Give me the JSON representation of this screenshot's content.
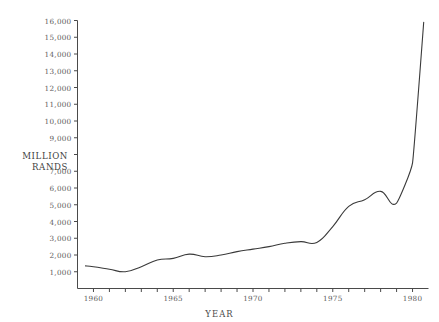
{
  "chart_data": {
    "type": "line",
    "title": "",
    "subtitle": "",
    "xlabel": "YEAR",
    "ylabel": "MILLION RANDS",
    "ylabel_lines": [
      "MILLION",
      "RANDS"
    ],
    "xlim": [
      1959,
      1981
    ],
    "ylim": [
      0,
      16000
    ],
    "grid": false,
    "legend": null,
    "y_ticks": [
      1000,
      2000,
      3000,
      4000,
      5000,
      6000,
      7000,
      8000,
      9000,
      10000,
      11000,
      12000,
      13000,
      14000,
      15000,
      16000
    ],
    "y_tick_labels": [
      "1,000",
      "2,000",
      "3,000",
      "4,000",
      "5,000",
      "6,000",
      "7,000",
      "",
      "9,000",
      "10,000",
      "11,000",
      "12,000",
      "13,000",
      "14,000",
      "15,000",
      "16,000"
    ],
    "y_tick_label_hidden_note": "8,000 tick label is replaced by the axis title MILLION RANDS",
    "x_ticks": [
      1960,
      1961,
      1962,
      1963,
      1964,
      1965,
      1966,
      1967,
      1968,
      1969,
      1970,
      1971,
      1972,
      1973,
      1974,
      1975,
      1976,
      1977,
      1978,
      1979,
      1980
    ],
    "x_tick_labels": [
      "1960",
      "",
      "",
      "",
      "",
      "1965",
      "",
      "",
      "",
      "",
      "1970",
      "",
      "",
      "",
      "",
      "1975",
      "",
      "",
      "",
      "",
      "1980"
    ],
    "x_major_labels": [
      "1960",
      "1965",
      "1970",
      "1975",
      "1980"
    ],
    "line_color": "#3a3a3a",
    "axis_color": "#4a4a4a",
    "x": [
      1959.5,
      1960,
      1961,
      1962,
      1963,
      1964,
      1965,
      1966,
      1967,
      1968,
      1969,
      1970,
      1971,
      1972,
      1973,
      1974,
      1975,
      1976,
      1977,
      1978,
      1979,
      1980,
      1980.7
    ],
    "values": [
      1350,
      1300,
      1150,
      1000,
      1300,
      1700,
      1800,
      2050,
      1900,
      2000,
      2200,
      2350,
      2500,
      2700,
      2800,
      2750,
      3700,
      4900,
      5300,
      5800,
      5100,
      7500,
      15900
    ],
    "series": [
      {
        "name": "Million Rands",
        "values": [
          1350,
          1300,
          1150,
          1000,
          1300,
          1700,
          1800,
          2050,
          1900,
          2000,
          2200,
          2350,
          2500,
          2700,
          2800,
          2750,
          3700,
          4900,
          5300,
          5800,
          5100,
          7500,
          15900
        ]
      }
    ]
  }
}
